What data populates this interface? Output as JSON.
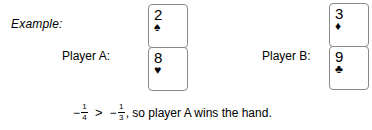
{
  "figure": {
    "example_label": "Example:",
    "player_a": {
      "label": "Player A:",
      "cards": [
        {
          "rank": "2",
          "suit_name": "spade-icon",
          "suit_glyph": "♠"
        },
        {
          "rank": "8",
          "suit_name": "heart-icon",
          "suit_glyph": "♥"
        }
      ]
    },
    "player_b": {
      "label": "Player B:",
      "cards": [
        {
          "rank": "3",
          "suit_name": "diamond-icon",
          "suit_glyph": "♦"
        },
        {
          "rank": "9",
          "suit_name": "club-icon",
          "suit_glyph": "♣"
        }
      ]
    },
    "conclusion": {
      "left_sign": "−",
      "left_numerator": "1",
      "left_denominator": "4",
      "relation": ">",
      "right_sign": "−",
      "right_numerator": "1",
      "right_denominator": "3",
      "tail": ", so player A wins the hand.",
      "plain_text": "− 1/4 > − 1/3, so player A wins the hand."
    },
    "colors": {
      "background": "#ffffff",
      "text": "#000000",
      "card_border": "#8a8a8a",
      "card_face": "#ffffff"
    }
  }
}
